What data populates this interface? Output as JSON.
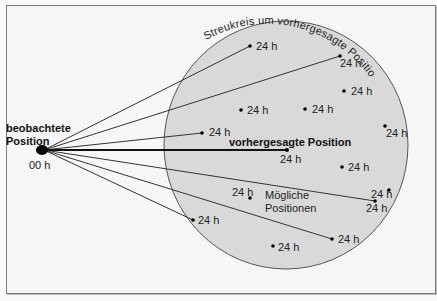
{
  "diagram": {
    "observed_label_line1": "beobachtete",
    "observed_label_line2": "Position",
    "observed_time": "00 h",
    "predicted_label": "vorhergesagte Position",
    "predicted_time": "24 h",
    "circle_label": "Streukreis um vorhergesagte Position",
    "possible_label_line1": "Mögliche",
    "possible_label_line2": "Positionen",
    "point_time": "24 h",
    "colors": {
      "circle_fill": "#d9d9d9",
      "line": "#333333",
      "frame": "#7a7a7a",
      "background": "#f6f6f6"
    }
  }
}
